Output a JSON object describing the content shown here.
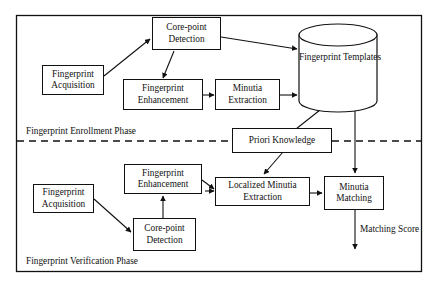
{
  "figure": {
    "outer_frame": "rectangle",
    "divider": "dashed-horizontal"
  },
  "phases": {
    "enrollment_label": "Fingerprint Enrollment Phase",
    "verification_label": "Fingerprint Verification Phase"
  },
  "enrollment": {
    "acquisition": {
      "line1": "Fingerprint",
      "line2": "Acquisition"
    },
    "corepoint": {
      "line1": "Core-point",
      "line2": "Detection"
    },
    "enhancement": {
      "line1": "Fingerprint",
      "line2": "Enhancement"
    },
    "minutia": {
      "line1": "Minutia",
      "line2": "Extraction"
    },
    "templates": {
      "line1": "Fingerprint",
      "line2": "Templates"
    }
  },
  "shared": {
    "priori": {
      "line1": "Priori Knowledge"
    }
  },
  "verification": {
    "acquisition": {
      "line1": "Fingerprint",
      "line2": "Acquisition"
    },
    "corepoint": {
      "line1": "Core-point",
      "line2": "Detection"
    },
    "enhancement": {
      "line1": "Fingerprint",
      "line2": "Enhancement"
    },
    "localized": {
      "line1": "Localized Minutia",
      "line2": "Extraction"
    },
    "matching": {
      "line1": "Minutia",
      "line2": "Matching"
    },
    "output": {
      "line1": "Matching",
      "line2": "Score"
    }
  },
  "colors": {
    "stroke": "#111111",
    "background": "#ffffff"
  }
}
